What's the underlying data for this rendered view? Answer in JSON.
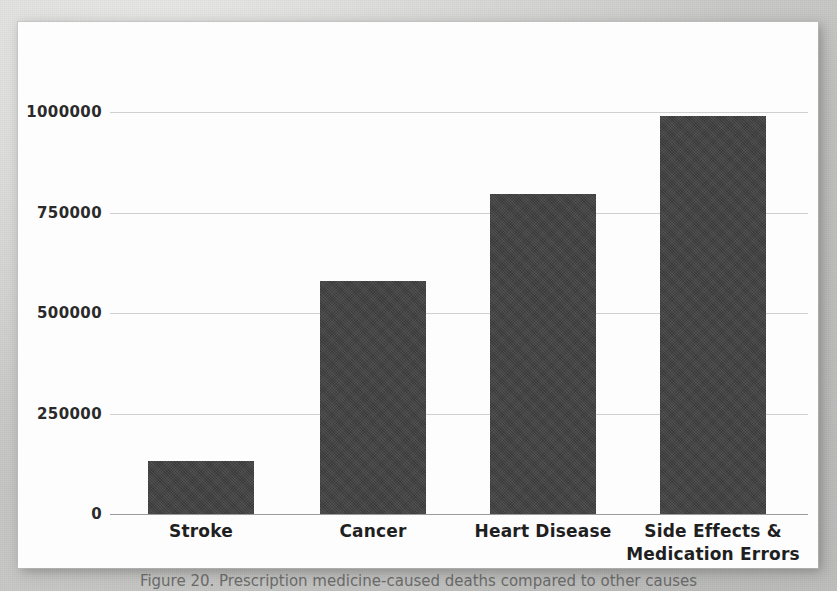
{
  "figure": {
    "caption": "Figure 20. Prescription medicine-caused deaths compared to other causes"
  },
  "colors": {
    "bar_fill": "#3f3f3f",
    "page_background": "#c8c8c6",
    "card_background": "#fdfdfd",
    "gridline": "#8c8c8c",
    "label_text": "#1f1f1f"
  },
  "chart_data": {
    "type": "bar",
    "title": "",
    "subtitle": "",
    "xlabel": "",
    "ylabel": "",
    "categories": [
      "Stroke",
      "Cancer",
      "Heart Disease",
      "Side Effects & Medication Errors"
    ],
    "category_lines": [
      [
        "Stroke"
      ],
      [
        "Cancer"
      ],
      [
        "Heart Disease"
      ],
      [
        "Side Effects &",
        "Medication Errors"
      ]
    ],
    "values": [
      133000,
      580000,
      797000,
      990000
    ],
    "ylim": [
      0,
      1000000
    ],
    "yticks": [
      0,
      250000,
      500000,
      750000,
      1000000
    ],
    "ytick_labels": [
      "0",
      "250000",
      "500000",
      "750000",
      "1000000"
    ],
    "grid": true,
    "legend": "none",
    "orientation": "vertical",
    "series": [
      {
        "name": "Annual deaths",
        "values": [
          133000,
          580000,
          797000,
          990000
        ]
      }
    ]
  }
}
